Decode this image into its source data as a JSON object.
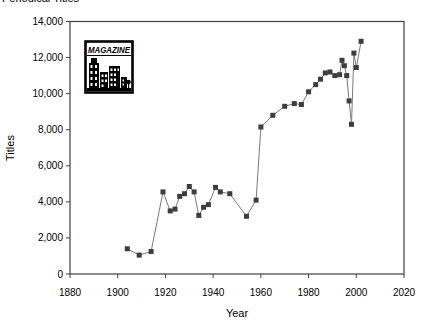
{
  "title": {
    "text": "Periodical Titles"
  },
  "chart_data": {
    "type": "line",
    "title": "Periodical Titles",
    "xlabel": "Year",
    "ylabel": "Titles",
    "xlim": [
      1880,
      2020
    ],
    "ylim": [
      0,
      14000
    ],
    "x_ticks": [
      1880,
      1900,
      1920,
      1940,
      1960,
      1980,
      2000,
      2020
    ],
    "y_ticks": [
      0,
      2000,
      4000,
      6000,
      8000,
      10000,
      12000,
      14000
    ],
    "y_tick_labels": [
      "0",
      "2,000",
      "4,000",
      "6,000",
      "8,000",
      "10,000",
      "12,000",
      "14,000"
    ],
    "grid": false,
    "legend_position": "none",
    "marker_shape": "square",
    "colors": {
      "marker": "#3d3d3d",
      "line": "#7a7a7a",
      "axis": "#404040",
      "text": "#000000",
      "background": "#ffffff"
    },
    "series": [
      {
        "name": "Titles",
        "points": [
          [
            1904,
            1400
          ],
          [
            1909,
            1050
          ],
          [
            1914,
            1250
          ],
          [
            1919,
            4550
          ],
          [
            1922,
            3500
          ],
          [
            1924,
            3600
          ],
          [
            1926,
            4300
          ],
          [
            1928,
            4450
          ],
          [
            1930,
            4850
          ],
          [
            1932,
            4550
          ],
          [
            1934,
            3250
          ],
          [
            1936,
            3700
          ],
          [
            1938,
            3850
          ],
          [
            1941,
            4800
          ],
          [
            1943,
            4550
          ],
          [
            1947,
            4450
          ],
          [
            1954,
            3200
          ],
          [
            1958,
            4100
          ],
          [
            1960,
            8150
          ],
          [
            1965,
            8800
          ],
          [
            1970,
            9300
          ],
          [
            1974,
            9450
          ],
          [
            1977,
            9400
          ],
          [
            1980,
            10100
          ],
          [
            1983,
            10500
          ],
          [
            1985,
            10800
          ],
          [
            1987,
            11150
          ],
          [
            1989,
            11200
          ],
          [
            1991,
            11000
          ],
          [
            1993,
            11050
          ],
          [
            1994,
            11850
          ],
          [
            1995,
            11550
          ],
          [
            1996,
            11000
          ],
          [
            1997,
            9600
          ],
          [
            1998,
            8300
          ],
          [
            1999,
            12250
          ],
          [
            2000,
            11450
          ],
          [
            2002,
            12900
          ]
        ]
      }
    ],
    "logo": {
      "text": "MAGAZINE"
    }
  }
}
